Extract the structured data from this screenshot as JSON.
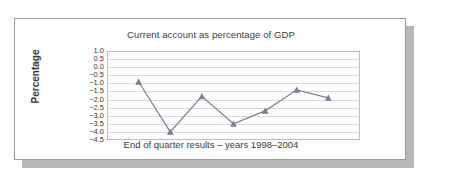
{
  "chart_data": {
    "type": "line",
    "title": "Current account as percentage of GDP",
    "xlabel": "End of quarter results – years 1998–2004",
    "ylabel": "Percentage",
    "ylim": [
      -4.5,
      1.0
    ],
    "ytick_step": 0.5,
    "ytick_labels": [
      "1.0",
      "0.5",
      "0.0",
      "−0.5",
      "−1.0",
      "−1.5",
      "−2.0",
      "−2.5",
      "−3.0",
      "−3.5",
      "−4.0",
      "−4.5"
    ],
    "ytick_values": [
      1.0,
      0.5,
      0.0,
      -0.5,
      -1.0,
      -1.5,
      -2.0,
      -2.5,
      -3.0,
      -3.5,
      -4.0,
      -4.5
    ],
    "grid": "horizontal",
    "legend": "none",
    "xtick_labels": [],
    "marker": "triangle",
    "series": [
      {
        "name": "Current account as percentage of GDP",
        "color": "#7a7f96",
        "values": [
          -0.9,
          -4.0,
          -1.8,
          -3.5,
          -2.7,
          -1.4,
          -1.9
        ]
      }
    ]
  }
}
